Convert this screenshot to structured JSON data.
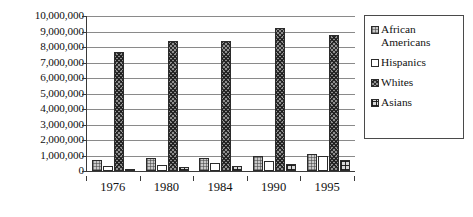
{
  "chart_data": {
    "type": "bar",
    "title": "",
    "subtitle": "",
    "xlabel": "",
    "ylabel": "",
    "categories": [
      "1976",
      "1980",
      "1984",
      "1990",
      "1995"
    ],
    "series": [
      {
        "name": "African Americans",
        "values": [
          700000,
          830000,
          820000,
          970000,
          1080000
        ],
        "pattern": "fine-grid-light"
      },
      {
        "name": "Hispanics",
        "values": [
          350000,
          420000,
          500000,
          670000,
          1000000
        ],
        "pattern": "solid-white"
      },
      {
        "name": "Whites",
        "values": [
          7700000,
          8400000,
          8420000,
          9250000,
          8800000
        ],
        "pattern": "dense-crosshatch-dark"
      },
      {
        "name": "Asians",
        "values": [
          150000,
          230000,
          320000,
          480000,
          690000
        ],
        "pattern": "coarse-grid-dark"
      }
    ],
    "ylim": [
      0,
      10000000
    ],
    "ytick_values": [
      0,
      1000000,
      2000000,
      3000000,
      4000000,
      5000000,
      6000000,
      7000000,
      8000000,
      9000000,
      10000000
    ],
    "ytick_labels": [
      "0",
      "1,000,000",
      "2,000,000",
      "3,000,000",
      "4,000,000",
      "5,000,000",
      "6,000,000",
      "7,000,000",
      "8,000,000",
      "9,000,000",
      "10,000,000"
    ],
    "grid": true,
    "grid_axis": "y",
    "legend_position": "right",
    "legend_entries": [
      "African Americans",
      "Hispanics",
      "Whites",
      "Asians"
    ],
    "colors": {
      "axis": "#3a3a3a",
      "gridline": "#8a8a8a",
      "bar_outline": "#2b2b2b",
      "african_americans": "#c9c9c9",
      "hispanics": "#ffffff",
      "whites": "#8f8f8f",
      "asians": "#d8d8d8",
      "background": "#ffffff",
      "text": "#111111"
    }
  }
}
